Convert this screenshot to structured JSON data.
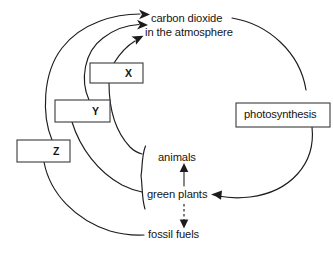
{
  "diagram": {
    "background_color": "#ffffff",
    "line_color": "#1c1c1c",
    "box_border_color": "#3a3a3a",
    "labels": {
      "carbon_dioxide_line1": "carbon dioxide",
      "carbon_dioxide_line2": "in the atmosphere",
      "animals": "animals",
      "green_plants": "green plants",
      "fossil_fuels": "fossil fuels"
    },
    "boxes": [
      {
        "id": "x",
        "label": "X",
        "align": "right"
      },
      {
        "id": "y",
        "label": "Y",
        "align": "right"
      },
      {
        "id": "z",
        "label": "Z",
        "align": "right"
      },
      {
        "id": "photosynthesis",
        "label": "photosynthesis",
        "align": "center"
      }
    ],
    "connections": [
      {
        "from": "X",
        "to": "carbon dioxide in the atmosphere",
        "style": "solid-arrow"
      },
      {
        "from": "Y",
        "to": "carbon dioxide in the atmosphere",
        "style": "solid-arrow"
      },
      {
        "from": "Z",
        "to": "carbon dioxide in the atmosphere",
        "style": "solid-arrow"
      },
      {
        "from": "X",
        "to": "animals",
        "style": "solid"
      },
      {
        "from": "Y",
        "to": "green plants",
        "style": "solid"
      },
      {
        "from": "Z",
        "to": "fossil fuels",
        "style": "solid"
      },
      {
        "from": "green plants",
        "to": "animals",
        "style": "solid-arrow"
      },
      {
        "from": "green plants",
        "to": "fossil fuels",
        "style": "dashed-arrow"
      },
      {
        "from": "carbon dioxide in the atmosphere",
        "to": "green plants",
        "style": "solid-arrow",
        "via": "photosynthesis"
      }
    ]
  }
}
